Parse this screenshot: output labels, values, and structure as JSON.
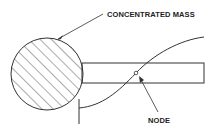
{
  "diagram": {
    "labels": {
      "concentrated_mass": "CONCENTRATED MASS",
      "node": "NODE"
    },
    "colors": {
      "stroke": "#333333",
      "background": "#ffffff"
    },
    "elements": {
      "mass": {
        "shape": "circle",
        "fill": "hatched"
      },
      "beam": {
        "shape": "rectangle"
      },
      "node_marker": {
        "shape": "small-circle"
      },
      "mode_shape": {
        "shape": "s-curve"
      },
      "base_line": {
        "shape": "vertical-line"
      }
    }
  }
}
